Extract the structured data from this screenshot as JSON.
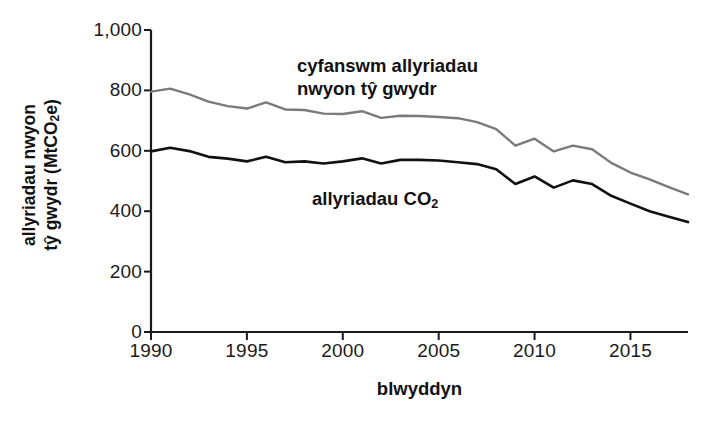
{
  "chart_data": {
    "type": "line",
    "title": "",
    "subtitle": "",
    "xlabel": "blwyddyn",
    "ylabel": "allyriadau nwyon tŷ gwydr (MtCO2e)",
    "ylabel_line1": "allyriadau nwyon",
    "ylabel_line2_prefix": "tŷ gwydr (MtCO",
    "ylabel_line2_sub": "2",
    "ylabel_line2_suffix": "e)",
    "xlim": [
      1990,
      2018
    ],
    "ylim": [
      0,
      1000
    ],
    "grid": false,
    "legend_position": "inline-annotation",
    "x_ticks": [
      1990,
      1995,
      2000,
      2005,
      2010,
      2015
    ],
    "x_tick_labels": [
      "1990",
      "1995",
      "2000",
      "2005",
      "2010",
      "2015"
    ],
    "y_ticks": [
      0,
      200,
      400,
      600,
      800,
      1000
    ],
    "y_tick_labels": [
      "0",
      "200",
      "400",
      "600",
      "800",
      "1,000"
    ],
    "x": [
      1990,
      1991,
      1992,
      1993,
      1994,
      1995,
      1996,
      1997,
      1998,
      1999,
      2000,
      2001,
      2002,
      2003,
      2004,
      2005,
      2006,
      2007,
      2008,
      2009,
      2010,
      2011,
      2012,
      2013,
      2014,
      2015,
      2016,
      2017,
      2018
    ],
    "series": [
      {
        "name": "cyfanswm allyriadau nwyon tŷ gwydr",
        "label_line1": "cyfanswm allyriadau",
        "label_line2": "nwyon tŷ gwydr",
        "color": "#7a7a7a",
        "width": 2.4,
        "values": [
          796,
          806,
          787,
          763,
          748,
          740,
          760,
          737,
          735,
          723,
          722,
          731,
          709,
          716,
          715,
          712,
          708,
          695,
          672,
          617,
          640,
          598,
          617,
          605,
          560,
          528,
          505,
          480,
          456
        ]
      },
      {
        "name": "allyriadau CO2",
        "label_line1": "allyriadau CO",
        "label_line2_sub": "2",
        "color": "#111111",
        "width": 2.6,
        "values": [
          598,
          610,
          599,
          580,
          574,
          565,
          580,
          562,
          565,
          558,
          565,
          575,
          558,
          570,
          570,
          568,
          562,
          556,
          539,
          490,
          515,
          478,
          502,
          490,
          451,
          425,
          400,
          382,
          364
        ]
      }
    ]
  },
  "axes": {
    "plot_left_px": 151,
    "plot_right_px": 688,
    "plot_top_px": 30,
    "plot_bottom_px": 332,
    "axis_color": "#1a1a1a"
  }
}
